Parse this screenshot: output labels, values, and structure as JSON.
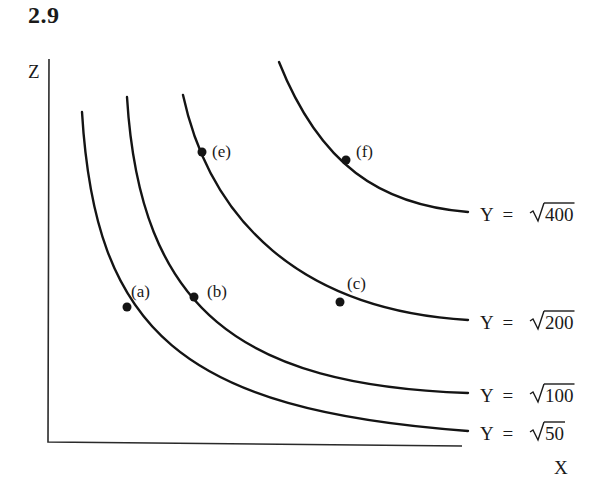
{
  "figure": {
    "number": "2.9"
  },
  "axes": {
    "y_label": "Z",
    "x_label": "X"
  },
  "curves": [
    {
      "id": "y50",
      "label_prefix": "Y  =  ",
      "radicand": "50",
      "label": "Y = √50",
      "path": "M 82 112 C 95 330, 180 410, 468 431",
      "label_x": 480,
      "label_y": 440
    },
    {
      "id": "y100",
      "label_prefix": "Y  =  ",
      "radicand": "100",
      "label": "Y = √100",
      "path": "M 127 97 C 140 310, 240 385, 468 393",
      "label_x": 480,
      "label_y": 402
    },
    {
      "id": "y200",
      "label_prefix": "Y  =  ",
      "radicand": "200",
      "label": "Y = √200",
      "path": "M 183 95 C 210 220, 300 310, 468 320",
      "label_x": 480,
      "label_y": 329
    },
    {
      "id": "y400",
      "label_prefix": "Y  =  ",
      "radicand": "400",
      "label": "Y = √400",
      "path": "M 279 62 C 320 165, 380 205, 468 212",
      "label_x": 480,
      "label_y": 221
    }
  ],
  "points": [
    {
      "label": "(a)",
      "x": 127,
      "y": 307,
      "lx": 131,
      "ly": 297
    },
    {
      "label": "(b)",
      "x": 194,
      "y": 297,
      "lx": 207,
      "ly": 297
    },
    {
      "label": "(c)",
      "x": 340,
      "y": 302,
      "lx": 347,
      "ly": 289
    },
    {
      "label": "(e)",
      "x": 202,
      "y": 152,
      "lx": 212,
      "ly": 157
    },
    {
      "label": "(f)",
      "x": 346,
      "y": 160,
      "lx": 356,
      "ly": 157
    }
  ],
  "chart_data": {
    "type": "line",
    "title": "2.9",
    "xlabel": "X",
    "ylabel": "Z",
    "series": [
      {
        "name": "Y = √50"
      },
      {
        "name": "Y = √100"
      },
      {
        "name": "Y = √200"
      },
      {
        "name": "Y = √400"
      }
    ],
    "annotations": [
      "(a)",
      "(b)",
      "(c)",
      "(e)",
      "(f)"
    ]
  }
}
